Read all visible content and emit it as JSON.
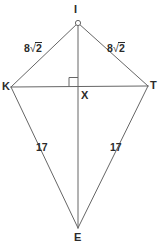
{
  "figure": {
    "kind": "geometry-diagram",
    "shape_name": "kite",
    "background_color": "#ffffff",
    "stroke_color": "#666666",
    "label_color": "#2b2b2b",
    "stroke_width": 1,
    "width": 159,
    "height": 251
  },
  "vertices": [
    {
      "id": "I",
      "label": "I",
      "x": 78,
      "y": 23,
      "marker": "small-circle"
    },
    {
      "id": "K",
      "label": "K",
      "x": 11,
      "y": 87,
      "marker": "none"
    },
    {
      "id": "T",
      "label": "T",
      "x": 148,
      "y": 86,
      "marker": "none"
    },
    {
      "id": "E",
      "label": "E",
      "x": 78,
      "y": 228,
      "marker": "none"
    },
    {
      "id": "X",
      "label": "X",
      "x": 78,
      "y": 86.5,
      "marker": "none"
    }
  ],
  "edges": [
    {
      "id": "KI",
      "from": "K",
      "to": "I",
      "label": "8√2"
    },
    {
      "id": "IT",
      "from": "I",
      "to": "T",
      "label": "8√2"
    },
    {
      "id": "KE",
      "from": "K",
      "to": "E",
      "label": "17"
    },
    {
      "id": "TE",
      "from": "T",
      "to": "E",
      "label": "17"
    }
  ],
  "diagonals": [
    {
      "id": "KT",
      "from": "K",
      "to": "T",
      "label": ""
    },
    {
      "id": "IE",
      "from": "I",
      "to": "E",
      "label": ""
    }
  ],
  "side_labels": {
    "upper_left": {
      "coefficient": "8",
      "radical": "√",
      "radicand": "2",
      "text": "8√2"
    },
    "upper_right": {
      "coefficient": "8",
      "radical": "√",
      "radicand": "2",
      "text": "8√2"
    },
    "lower_left": {
      "text": "17"
    },
    "lower_right": {
      "text": "17"
    }
  },
  "markers": {
    "right_angle": {
      "name": "right-angle-square",
      "at_vertex": "X",
      "size": 9,
      "quadrant": "upper-left"
    },
    "apex_point": {
      "name": "apex-point-marker",
      "at_vertex": "I",
      "radius": 2.6
    }
  }
}
